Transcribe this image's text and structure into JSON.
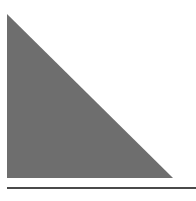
{
  "diagram": {
    "shapes": [
      {
        "type": "right-triangle",
        "points": [
          [
            7,
            14
          ],
          [
            7,
            178
          ],
          [
            173,
            178
          ]
        ],
        "fill": "#6e6e6e"
      }
    ],
    "lines": [
      {
        "type": "baseline",
        "x1": 7,
        "y1": 188,
        "x2": 196,
        "y2": 188,
        "stroke": "#4a4a4a",
        "width": 2
      }
    ],
    "background": "#ffffff"
  }
}
